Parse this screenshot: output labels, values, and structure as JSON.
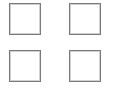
{
  "grid": {
    "rows": 2,
    "columns": 2,
    "items": [
      {
        "id": "b0",
        "label": "",
        "border_color": "#7a7a7a"
      },
      {
        "id": "b1",
        "label": "",
        "border_color": "#7a7a7a"
      },
      {
        "id": "b2",
        "label": "",
        "border_color": "#7a7a7a"
      },
      {
        "id": "b3",
        "label": "",
        "border_color": "#7a7a7a"
      }
    ]
  },
  "colors": {
    "background": "#ffffff",
    "border": "#7a7a7a"
  }
}
